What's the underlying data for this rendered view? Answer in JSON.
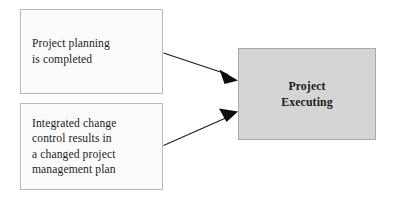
{
  "diagram": {
    "background_color": "#ffffff",
    "nodes": {
      "planning": {
        "name": "Project planning is completed",
        "lines": [
          "Project planning",
          "is completed"
        ],
        "fill_color": "#fbfbfb",
        "border_color": "#b9b9b9",
        "text_color": "#1b1b1b"
      },
      "change_control": {
        "name": "Integrated change control results",
        "lines": [
          "Integrated change",
          "control results in",
          "a changed project",
          "management plan"
        ],
        "fill_color": "#fbfbfb",
        "border_color": "#b9b9b9",
        "text_color": "#1b1b1b"
      },
      "executing": {
        "name": "Project Executing",
        "lines": [
          "Project",
          "Executing"
        ],
        "fill_color": "#d5d5d5",
        "border_color": "#a8a8a8",
        "text_color": "#111111"
      }
    },
    "connectors": [
      {
        "id": "planning-to-executing",
        "from": "planning",
        "to": "executing",
        "style": "solid-arrow",
        "color": "#1a1a1a"
      },
      {
        "id": "change-control-to-executing",
        "from": "change_control",
        "to": "executing",
        "style": "solid-arrow",
        "color": "#1a1a1a"
      }
    ]
  }
}
